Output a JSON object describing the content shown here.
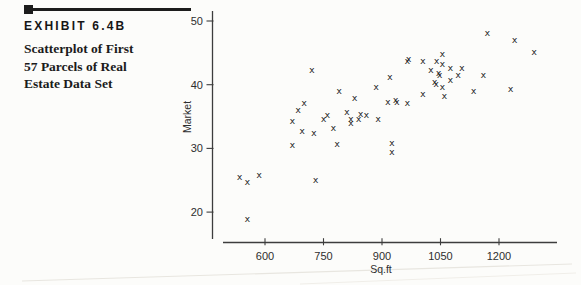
{
  "exhibit": {
    "label": "EXHIBIT 6.4B",
    "caption": "Scatterplot of First\n57 Parcels of Real\nEstate Data Set"
  },
  "chart_data": {
    "type": "scatter",
    "marker": "x",
    "xlabel": "Sq.ft",
    "ylabel": "Market",
    "x_ticks": [
      600,
      750,
      900,
      1050,
      1200
    ],
    "y_ticks": [
      50,
      40,
      30,
      20
    ],
    "xlim": [
      490,
      1350
    ],
    "ylim": [
      16.5,
      51.5
    ],
    "grid": false,
    "legend": "none",
    "points": [
      [
        535,
        25.4
      ],
      [
        555,
        24.6
      ],
      [
        585,
        25.7
      ],
      [
        555,
        18.9
      ],
      [
        670,
        30.5
      ],
      [
        730,
        25.0
      ],
      [
        785,
        30.7
      ],
      [
        720,
        42.2
      ],
      [
        790,
        39.0
      ],
      [
        830,
        37.8
      ],
      [
        700,
        37.1
      ],
      [
        685,
        36.0
      ],
      [
        670,
        34.3
      ],
      [
        750,
        34.6
      ],
      [
        760,
        35.2
      ],
      [
        695,
        32.6
      ],
      [
        725,
        32.3
      ],
      [
        775,
        33.2
      ],
      [
        965,
        43.7
      ],
      [
        968,
        43.9
      ],
      [
        920,
        41.1
      ],
      [
        885,
        39.5
      ],
      [
        915,
        37.2
      ],
      [
        935,
        37.6
      ],
      [
        938,
        37.2
      ],
      [
        965,
        37.0
      ],
      [
        810,
        35.6
      ],
      [
        845,
        35.4
      ],
      [
        860,
        35.2
      ],
      [
        820,
        34.6
      ],
      [
        840,
        34.6
      ],
      [
        890,
        34.6
      ],
      [
        820,
        34.0
      ],
      [
        1055,
        44.7
      ],
      [
        1005,
        43.7
      ],
      [
        1040,
        43.7
      ],
      [
        1055,
        43.2
      ],
      [
        1075,
        42.6
      ],
      [
        1025,
        42.2
      ],
      [
        1105,
        42.5
      ],
      [
        1045,
        41.7
      ],
      [
        1048,
        41.4
      ],
      [
        1095,
        41.4
      ],
      [
        1075,
        40.7
      ],
      [
        1160,
        41.5
      ],
      [
        1035,
        40.3
      ],
      [
        1039,
        40.0
      ],
      [
        1055,
        39.5
      ],
      [
        1135,
        39.0
      ],
      [
        1005,
        38.4
      ],
      [
        1060,
        38.2
      ],
      [
        1170,
        48.1
      ],
      [
        1240,
        47.0
      ],
      [
        1290,
        45.0
      ],
      [
        1230,
        39.3
      ],
      [
        925,
        30.8
      ],
      [
        925,
        29.4
      ]
    ]
  }
}
